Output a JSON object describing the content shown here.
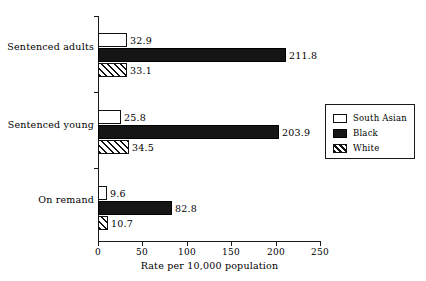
{
  "chart_data": {
    "type": "bar",
    "orientation": "horizontal",
    "title": "",
    "subtitle": "",
    "xlabel": "Rate per 10,000 population",
    "ylabel": "",
    "xlim": [
      0,
      250
    ],
    "xticks": [
      0,
      50,
      100,
      150,
      200,
      250
    ],
    "xtick_labels": [
      "0",
      "50",
      "100",
      "150",
      "200",
      "250"
    ],
    "grid": false,
    "legend_position": "right",
    "categories": [
      "Sentenced adults",
      "Sentenced young",
      "On remand"
    ],
    "series": [
      {
        "name": "South Asian",
        "swatch": "south-asian",
        "values": [
          32.9,
          25.8,
          9.6
        ],
        "labels": [
          "32.9",
          "25.8",
          "9.6"
        ]
      },
      {
        "name": "Black",
        "swatch": "black",
        "values": [
          211.8,
          203.9,
          82.8
        ],
        "labels": [
          "211.8",
          "203.9",
          "82.8"
        ]
      },
      {
        "name": "White",
        "swatch": "white",
        "values": [
          33.1,
          34.5,
          10.7
        ],
        "labels": [
          "33.1",
          "34.5",
          "10.7"
        ]
      }
    ]
  },
  "axis": {
    "x_title": "Rate per 10,000 population",
    "ticks": [
      {
        "value": "0"
      },
      {
        "value": "50"
      },
      {
        "value": "100"
      },
      {
        "value": "150"
      },
      {
        "value": "200"
      },
      {
        "value": "250"
      }
    ]
  },
  "categories": [
    {
      "label": "Sentenced adults"
    },
    {
      "label": "Sentenced young"
    },
    {
      "label": "On remand"
    }
  ],
  "legend": {
    "items": [
      {
        "label": "South Asian",
        "swatch": "south-asian"
      },
      {
        "label": "Black",
        "swatch": "black"
      },
      {
        "label": "White",
        "swatch": "white"
      }
    ]
  },
  "values": {
    "g0s0": "32.9",
    "g0s1": "211.8",
    "g0s2": "33.1",
    "g1s0": "25.8",
    "g1s1": "203.9",
    "g1s2": "34.5",
    "g2s0": "9.6",
    "g2s1": "82.8",
    "g2s2": "10.7"
  },
  "colors": {
    "axis": "#1a1a1a",
    "bar_black": "#151515",
    "bar_outline": "#111111",
    "background": "#ffffff"
  }
}
